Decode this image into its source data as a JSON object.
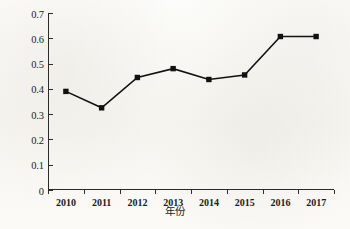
{
  "chart_data": {
    "type": "line",
    "title": "",
    "xlabel": "年份",
    "ylabel": "生态承载力指数",
    "categories": [
      "2010",
      "2011",
      "2012",
      "2013",
      "2014",
      "2015",
      "2016",
      "2017"
    ],
    "x": [
      2010,
      2011,
      2012,
      2013,
      2014,
      2015,
      2016,
      2017
    ],
    "values": [
      0.39,
      0.325,
      0.445,
      0.48,
      0.437,
      0.455,
      0.607,
      0.607
    ],
    "series": [
      {
        "name": "生态承载力指数",
        "values": [
          0.39,
          0.325,
          0.445,
          0.48,
          0.437,
          0.455,
          0.607,
          0.607
        ]
      }
    ],
    "ylim": [
      0,
      0.7
    ],
    "ytick_labels": [
      "0",
      "0.1",
      "0.2",
      "0.3",
      "0.4",
      "0.5",
      "0.6",
      "0.7"
    ],
    "ytick_values": [
      0,
      0.1,
      0.2,
      0.3,
      0.4,
      0.5,
      0.6,
      0.7
    ],
    "grid": false,
    "legend": null,
    "legend_position": "none",
    "marker": "square",
    "line_color": "#111111",
    "marker_color": "#111111",
    "axis_color": "#2b2b2b",
    "background_color": "#fbfbf9"
  }
}
